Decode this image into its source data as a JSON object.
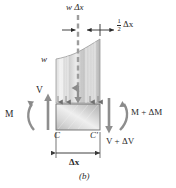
{
  "figure": {
    "caption": "(b)",
    "type": "free-body-diagram"
  },
  "labels": {
    "distributed_load_resultant": "w Δx",
    "half_dx": "Δx",
    "half_fraction_numerator": "1",
    "half_fraction_denominator": "2",
    "load_intensity": "w",
    "shear_left": "V",
    "moment_left": "M",
    "moment_right": "M + ΔM",
    "shear_right": "V + ΔV",
    "point_left": "C",
    "point_right": "C'",
    "width_dimension": "Δx"
  },
  "colors": {
    "background": "#ffffff",
    "ink": "#2a2a2a",
    "element_fill_light": "#e9e9e9",
    "element_fill_dark": "#b9b9b9",
    "outline": "#6e6e6e",
    "dashed_centerline": "#9a9a9a"
  }
}
